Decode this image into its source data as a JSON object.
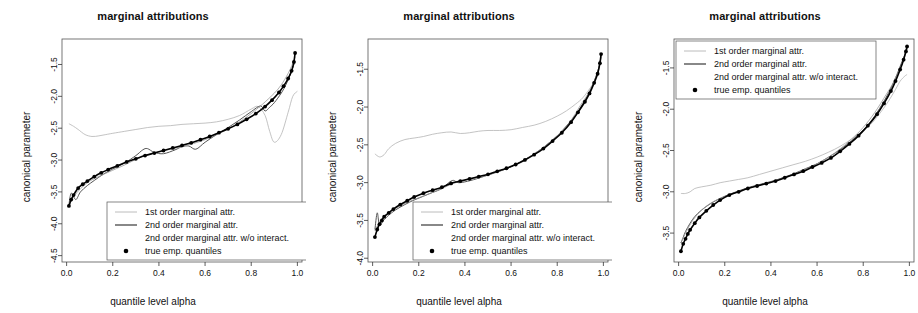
{
  "figure": {
    "panel_count": 3,
    "colors": {
      "first_order": "#b4b4b4",
      "second_order": "#555555",
      "second_order_no_interact": "#9a9a9a",
      "true_quantiles": "#000000",
      "axis": "#333333",
      "background": "#ffffff"
    }
  },
  "panels": [
    {
      "title": "marginal attributions",
      "xlabel": "quantile level alpha",
      "ylabel": "canonical parameter",
      "xticks": [
        "0.0",
        "0.2",
        "0.4",
        "0.6",
        "0.8",
        "1.0"
      ],
      "yticks": [
        "-1.5",
        "-2.0",
        "-2.5",
        "-3.0",
        "-3.5",
        "-4.0",
        "-4.5"
      ],
      "legend_position": "bottom-left",
      "legend": [
        "1st order marginal attr.",
        "2nd order marginal attr.",
        "2nd order marginal attr. w/o interact.",
        "true emp. quantiles"
      ]
    },
    {
      "title": "marginal attributions",
      "xlabel": "quantile level alpha",
      "ylabel": "canonical parameter",
      "xticks": [
        "0.0",
        "0.2",
        "0.4",
        "0.6",
        "0.8",
        "1.0"
      ],
      "yticks": [
        "-1.5",
        "-2.0",
        "-2.5",
        "-3.0",
        "-3.5",
        "-4.0"
      ],
      "legend_position": "bottom-left",
      "legend": [
        "1st order marginal attr.",
        "2nd order marginal attr.",
        "2nd order marginal attr. w/o interact.",
        "true emp. quantiles"
      ]
    },
    {
      "title": "marginal attributions",
      "xlabel": "quantile level alpha",
      "ylabel": "canonical parameter",
      "xticks": [
        "0.0",
        "0.2",
        "0.4",
        "0.6",
        "0.8",
        "1.0"
      ],
      "yticks": [
        "-1.5",
        "-2.0",
        "-2.5",
        "-3.0",
        "-3.5"
      ],
      "legend_position": "top-left",
      "legend": [
        "1st order marginal attr.",
        "2nd order marginal attr.",
        "2nd order marginal attr. w/o interact.",
        "true emp. quantiles"
      ]
    }
  ],
  "chart_data": [
    {
      "type": "line",
      "title": "marginal attributions",
      "xlabel": "quantile level alpha",
      "ylabel": "canonical parameter",
      "xlim": [
        -0.02,
        1.02
      ],
      "ylim": [
        -4.6,
        -1.1
      ],
      "grid": false,
      "legend": "bottom-left",
      "series": [
        {
          "name": "1st order marginal attr.",
          "color": "#b4b4b4",
          "x": [
            0.01,
            0.03,
            0.05,
            0.08,
            0.11,
            0.14,
            0.17,
            0.2,
            0.25,
            0.3,
            0.35,
            0.4,
            0.45,
            0.5,
            0.55,
            0.6,
            0.65,
            0.7,
            0.75,
            0.8,
            0.83,
            0.86,
            0.88,
            0.9,
            0.93,
            0.96,
            0.98,
            1.0
          ],
          "y": [
            -2.43,
            -2.47,
            -2.52,
            -2.6,
            -2.63,
            -2.62,
            -2.6,
            -2.58,
            -2.55,
            -2.52,
            -2.49,
            -2.47,
            -2.46,
            -2.44,
            -2.43,
            -2.42,
            -2.4,
            -2.36,
            -2.3,
            -2.2,
            -2.16,
            -2.3,
            -2.55,
            -2.72,
            -2.6,
            -2.25,
            -2.0,
            -1.92
          ]
        },
        {
          "name": "2nd order marginal attr.",
          "color": "#555555",
          "x": [
            0.01,
            0.02,
            0.04,
            0.06,
            0.09,
            0.12,
            0.16,
            0.2,
            0.25,
            0.3,
            0.33,
            0.35,
            0.38,
            0.42,
            0.47,
            0.5,
            0.53,
            0.56,
            0.6,
            0.65,
            0.7,
            0.75,
            0.8,
            0.84,
            0.86,
            0.88,
            0.9,
            0.93,
            0.95,
            0.97,
            0.99
          ],
          "y": [
            -3.7,
            -3.52,
            -3.62,
            -3.5,
            -3.4,
            -3.32,
            -3.22,
            -3.14,
            -3.05,
            -2.93,
            -2.84,
            -2.82,
            -2.88,
            -2.9,
            -2.84,
            -2.79,
            -2.78,
            -2.83,
            -2.72,
            -2.6,
            -2.49,
            -2.37,
            -2.24,
            -2.15,
            -2.23,
            -2.17,
            -2.1,
            -1.95,
            -1.82,
            -1.65,
            -1.45
          ]
        },
        {
          "name": "2nd order marginal attr. w/o interact.",
          "color": "#9a9a9a",
          "x": [
            0.01,
            0.03,
            0.06,
            0.1,
            0.15,
            0.2,
            0.25,
            0.3,
            0.35,
            0.4,
            0.45,
            0.5,
            0.55,
            0.6,
            0.65,
            0.7,
            0.75,
            0.8,
            0.85,
            0.9,
            0.93,
            0.96,
            0.98,
            0.99
          ],
          "y": [
            -3.72,
            -3.58,
            -3.45,
            -3.33,
            -3.24,
            -3.16,
            -3.08,
            -2.99,
            -2.92,
            -2.87,
            -2.83,
            -2.79,
            -2.74,
            -2.68,
            -2.6,
            -2.51,
            -2.4,
            -2.27,
            -2.12,
            -1.95,
            -1.82,
            -1.64,
            -1.48,
            -1.38
          ]
        },
        {
          "name": "true emp. quantiles",
          "color": "#000000",
          "marker": "dot",
          "x": [
            0.01,
            0.02,
            0.03,
            0.05,
            0.07,
            0.09,
            0.12,
            0.15,
            0.18,
            0.22,
            0.26,
            0.3,
            0.34,
            0.38,
            0.42,
            0.46,
            0.5,
            0.54,
            0.58,
            0.62,
            0.66,
            0.7,
            0.74,
            0.78,
            0.82,
            0.86,
            0.89,
            0.92,
            0.94,
            0.96,
            0.975,
            0.985,
            0.99
          ],
          "y": [
            -3.72,
            -3.62,
            -3.55,
            -3.44,
            -3.38,
            -3.33,
            -3.26,
            -3.2,
            -3.15,
            -3.09,
            -3.03,
            -2.98,
            -2.93,
            -2.89,
            -2.85,
            -2.81,
            -2.77,
            -2.73,
            -2.68,
            -2.63,
            -2.57,
            -2.51,
            -2.44,
            -2.36,
            -2.27,
            -2.16,
            -2.06,
            -1.94,
            -1.84,
            -1.72,
            -1.6,
            -1.46,
            -1.32
          ]
        }
      ]
    },
    {
      "type": "line",
      "title": "marginal attributions",
      "xlabel": "quantile level alpha",
      "ylabel": "canonical parameter",
      "xlim": [
        -0.02,
        1.02
      ],
      "ylim": [
        -4.05,
        -1.1
      ],
      "grid": false,
      "legend": "bottom-left",
      "series": [
        {
          "name": "1st order marginal attr.",
          "color": "#b4b4b4",
          "x": [
            0.01,
            0.03,
            0.05,
            0.07,
            0.1,
            0.14,
            0.18,
            0.22,
            0.26,
            0.3,
            0.34,
            0.38,
            0.42,
            0.46,
            0.5,
            0.55,
            0.6,
            0.65,
            0.7,
            0.75,
            0.8,
            0.84,
            0.88,
            0.91,
            0.94,
            0.96,
            0.98,
            0.99
          ],
          "y": [
            -2.62,
            -2.66,
            -2.63,
            -2.55,
            -2.48,
            -2.43,
            -2.41,
            -2.39,
            -2.36,
            -2.34,
            -2.33,
            -2.35,
            -2.34,
            -2.32,
            -2.31,
            -2.31,
            -2.3,
            -2.27,
            -2.24,
            -2.19,
            -2.12,
            -2.05,
            -1.96,
            -1.88,
            -1.76,
            -1.66,
            -1.5,
            -1.36
          ]
        },
        {
          "name": "2nd order marginal attr.",
          "color": "#555555",
          "x": [
            0.01,
            0.02,
            0.03,
            0.05,
            0.07,
            0.1,
            0.14,
            0.18,
            0.22,
            0.26,
            0.3,
            0.33,
            0.35,
            0.37,
            0.4,
            0.45,
            0.5,
            0.55,
            0.6,
            0.65,
            0.7,
            0.75,
            0.8,
            0.84,
            0.88,
            0.91,
            0.94,
            0.96,
            0.98,
            0.99
          ],
          "y": [
            -3.62,
            -3.4,
            -3.56,
            -3.49,
            -3.43,
            -3.36,
            -3.29,
            -3.23,
            -3.18,
            -3.13,
            -3.08,
            -3.0,
            -2.97,
            -3.0,
            -2.99,
            -2.95,
            -2.9,
            -2.85,
            -2.79,
            -2.71,
            -2.62,
            -2.51,
            -2.38,
            -2.25,
            -2.1,
            -1.96,
            -1.8,
            -1.66,
            -1.48,
            -1.33
          ]
        },
        {
          "name": "2nd order marginal attr. w/o interact.",
          "color": "#9a9a9a",
          "x": [
            0.01,
            0.03,
            0.06,
            0.1,
            0.15,
            0.2,
            0.25,
            0.3,
            0.35,
            0.4,
            0.45,
            0.5,
            0.55,
            0.6,
            0.65,
            0.7,
            0.75,
            0.8,
            0.85,
            0.9,
            0.93,
            0.96,
            0.98,
            0.99
          ],
          "y": [
            -3.64,
            -3.52,
            -3.42,
            -3.34,
            -3.26,
            -3.2,
            -3.14,
            -3.08,
            -3.01,
            -2.97,
            -2.94,
            -2.9,
            -2.85,
            -2.79,
            -2.71,
            -2.62,
            -2.51,
            -2.38,
            -2.22,
            -1.98,
            -1.84,
            -1.66,
            -1.48,
            -1.34
          ]
        },
        {
          "name": "true emp. quantiles",
          "color": "#000000",
          "marker": "dot",
          "x": [
            0.01,
            0.02,
            0.03,
            0.04,
            0.05,
            0.07,
            0.09,
            0.12,
            0.15,
            0.18,
            0.22,
            0.26,
            0.3,
            0.34,
            0.38,
            0.42,
            0.46,
            0.5,
            0.54,
            0.58,
            0.62,
            0.66,
            0.7,
            0.74,
            0.78,
            0.82,
            0.86,
            0.89,
            0.92,
            0.94,
            0.96,
            0.975,
            0.985,
            0.99
          ],
          "y": [
            -3.72,
            -3.62,
            -3.55,
            -3.5,
            -3.45,
            -3.4,
            -3.35,
            -3.29,
            -3.24,
            -3.19,
            -3.14,
            -3.1,
            -3.06,
            -3.01,
            -2.98,
            -2.95,
            -2.92,
            -2.89,
            -2.85,
            -2.81,
            -2.76,
            -2.7,
            -2.63,
            -2.55,
            -2.45,
            -2.34,
            -2.2,
            -2.07,
            -1.93,
            -1.82,
            -1.68,
            -1.56,
            -1.42,
            -1.3
          ]
        }
      ]
    },
    {
      "type": "line",
      "title": "marginal attributions",
      "xlabel": "quantile level alpha",
      "ylabel": "canonical parameter",
      "xlim": [
        -0.02,
        1.02
      ],
      "ylim": [
        -3.85,
        -1.15
      ],
      "grid": false,
      "legend": "top-left",
      "series": [
        {
          "name": "1st order marginal attr.",
          "color": "#b4b4b4",
          "x": [
            0.01,
            0.03,
            0.05,
            0.07,
            0.1,
            0.14,
            0.18,
            0.22,
            0.26,
            0.3,
            0.35,
            0.4,
            0.45,
            0.5,
            0.55,
            0.6,
            0.65,
            0.7,
            0.75,
            0.8,
            0.84,
            0.88,
            0.91,
            0.94,
            0.96,
            0.98,
            0.99
          ],
          "y": [
            -3.02,
            -3.02,
            -3.0,
            -2.96,
            -2.94,
            -2.92,
            -2.89,
            -2.87,
            -2.85,
            -2.83,
            -2.79,
            -2.75,
            -2.71,
            -2.67,
            -2.63,
            -2.58,
            -2.52,
            -2.45,
            -2.36,
            -2.26,
            -2.16,
            -2.02,
            -1.9,
            -1.76,
            -1.66,
            -1.6,
            -1.58
          ]
        },
        {
          "name": "2nd order marginal attr.",
          "color": "#555555",
          "x": [
            0.01,
            0.02,
            0.03,
            0.05,
            0.07,
            0.1,
            0.14,
            0.18,
            0.22,
            0.26,
            0.3,
            0.34,
            0.38,
            0.42,
            0.46,
            0.5,
            0.55,
            0.6,
            0.65,
            0.7,
            0.75,
            0.8,
            0.84,
            0.88,
            0.91,
            0.94,
            0.96,
            0.98,
            0.99
          ],
          "y": [
            -3.62,
            -3.55,
            -3.48,
            -3.38,
            -3.3,
            -3.22,
            -3.14,
            -3.08,
            -3.03,
            -2.99,
            -2.95,
            -2.92,
            -2.89,
            -2.86,
            -2.82,
            -2.78,
            -2.72,
            -2.66,
            -2.58,
            -2.49,
            -2.38,
            -2.25,
            -2.12,
            -1.95,
            -1.8,
            -1.62,
            -1.48,
            -1.34,
            -1.25
          ]
        },
        {
          "name": "2nd order marginal attr. w/o interact.",
          "color": "#9a9a9a",
          "x": [
            0.01,
            0.03,
            0.06,
            0.1,
            0.15,
            0.2,
            0.25,
            0.3,
            0.35,
            0.4,
            0.45,
            0.5,
            0.55,
            0.6,
            0.65,
            0.7,
            0.75,
            0.8,
            0.85,
            0.9,
            0.93,
            0.96,
            0.98,
            0.99
          ],
          "y": [
            -3.62,
            -3.5,
            -3.35,
            -3.22,
            -3.12,
            -3.06,
            -3.01,
            -2.96,
            -2.92,
            -2.88,
            -2.84,
            -2.79,
            -2.73,
            -2.66,
            -2.58,
            -2.48,
            -2.36,
            -2.22,
            -2.04,
            -1.82,
            -1.68,
            -1.5,
            -1.36,
            -1.27
          ]
        },
        {
          "name": "true emp. quantiles",
          "color": "#000000",
          "marker": "dot",
          "x": [
            0.01,
            0.02,
            0.03,
            0.04,
            0.05,
            0.07,
            0.09,
            0.12,
            0.15,
            0.18,
            0.22,
            0.26,
            0.3,
            0.34,
            0.38,
            0.42,
            0.46,
            0.5,
            0.54,
            0.58,
            0.62,
            0.66,
            0.7,
            0.74,
            0.78,
            0.82,
            0.86,
            0.89,
            0.92,
            0.94,
            0.96,
            0.975,
            0.985,
            0.99
          ],
          "y": [
            -3.72,
            -3.63,
            -3.57,
            -3.51,
            -3.46,
            -3.38,
            -3.31,
            -3.23,
            -3.16,
            -3.1,
            -3.04,
            -3.0,
            -2.96,
            -2.93,
            -2.9,
            -2.87,
            -2.83,
            -2.79,
            -2.75,
            -2.7,
            -2.65,
            -2.59,
            -2.51,
            -2.42,
            -2.32,
            -2.2,
            -2.06,
            -1.93,
            -1.78,
            -1.66,
            -1.52,
            -1.4,
            -1.3,
            -1.24
          ]
        }
      ]
    }
  ]
}
